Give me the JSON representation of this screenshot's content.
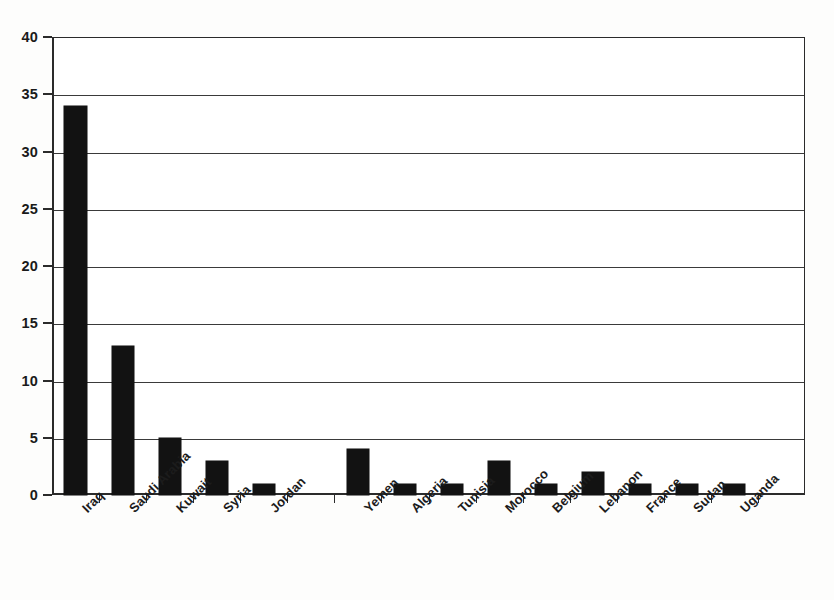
{
  "chart_data": {
    "type": "bar",
    "title": "",
    "subtitle": "",
    "xlabel": "",
    "ylabel": "",
    "ylim": [
      0,
      40
    ],
    "ytick_step": 5,
    "yticks": [
      0,
      5,
      10,
      15,
      20,
      25,
      30,
      35,
      40
    ],
    "ytick_labels": [
      "0",
      "5",
      "10",
      "15",
      "20",
      "25",
      "30",
      "35",
      "40"
    ],
    "grid": true,
    "grid_axis": "y",
    "legend": false,
    "legend_position": "none",
    "bar_color": "#121212",
    "axis_color": "#2b2b2b",
    "background_color": "#ffffff",
    "categories": [
      "Iraq",
      "Saudi Arabia",
      "Kuwait",
      "Syria",
      "Jordan",
      "",
      "Yemen",
      "Algeria",
      "Tunisia",
      "Morocco",
      "Belgium",
      "Lebanon",
      "France",
      "Sudan",
      "Uganda"
    ],
    "values": [
      34,
      13,
      5,
      3,
      1,
      0,
      4,
      1,
      1,
      3,
      1,
      2,
      1,
      1,
      1
    ],
    "n_slots": 16
  },
  "axes": {
    "y_min_label": "0",
    "y_max_label": "40"
  }
}
